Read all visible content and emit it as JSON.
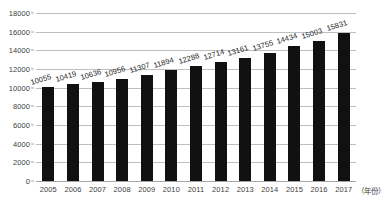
{
  "chart_data": {
    "type": "bar",
    "title": "",
    "xlabel": "（年份）",
    "ylabel": "",
    "categories": [
      "2005",
      "2006",
      "2007",
      "2008",
      "2009",
      "2010",
      "2011",
      "2012",
      "2013",
      "2014",
      "2015",
      "2016",
      "2017"
    ],
    "values": [
      10055,
      10419,
      10636,
      10956,
      11307,
      11894,
      12288,
      12714,
      13161,
      13755,
      14434,
      15003,
      15831
    ],
    "data_labels": [
      "10055",
      "10419",
      "10636",
      "10956",
      "11307",
      "11894",
      "12288",
      "12714",
      "13161",
      "13755",
      "14434",
      "15003",
      "15831"
    ],
    "ylim": [
      0,
      18000
    ],
    "yticks": [
      0,
      2000,
      4000,
      6000,
      8000,
      10000,
      12000,
      14000,
      16000,
      18000
    ],
    "ytick_labels": [
      "0",
      "2000",
      "4000",
      "6000",
      "8000",
      "10000",
      "12000",
      "14000",
      "16000",
      "18000"
    ],
    "grid": true,
    "legend": "none",
    "series_color": "#111111",
    "gridline_color": "#bfbfbf",
    "label_rotation_deg": -17
  }
}
